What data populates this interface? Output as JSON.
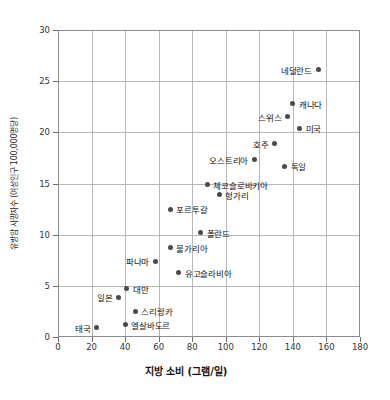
{
  "chart_data": {
    "type": "scatter",
    "title": "",
    "xlabel": "지방 소비 (그램/일)",
    "ylabel": "유방암 사망자수 (여성인구 100,000명당)",
    "xlim": [
      0,
      180
    ],
    "ylim": [
      0,
      30
    ],
    "xticks": [
      0,
      20,
      40,
      60,
      80,
      100,
      120,
      140,
      160,
      180
    ],
    "yticks": [
      0,
      5,
      10,
      15,
      20,
      25,
      30
    ],
    "grid": true,
    "legend": "none",
    "points": [
      {
        "label": "태국",
        "x": 23,
        "y": 0.9,
        "side": "left"
      },
      {
        "label": "엘살바도르",
        "x": 40,
        "y": 1.2,
        "side": "right"
      },
      {
        "label": "스리랑카",
        "x": 46,
        "y": 2.5,
        "side": "right"
      },
      {
        "label": "일본",
        "x": 36,
        "y": 3.9,
        "side": "left"
      },
      {
        "label": "대만",
        "x": 41,
        "y": 4.7,
        "side": "right"
      },
      {
        "label": "유고슬라비아",
        "x": 72,
        "y": 6.3,
        "side": "right"
      },
      {
        "label": "파나마",
        "x": 58,
        "y": 7.4,
        "side": "left"
      },
      {
        "label": "불가리아",
        "x": 67,
        "y": 8.7,
        "side": "right"
      },
      {
        "label": "폴란드",
        "x": 85,
        "y": 10.2,
        "side": "right"
      },
      {
        "label": "포르투갈",
        "x": 67,
        "y": 12.5,
        "side": "right"
      },
      {
        "label": "헝가리",
        "x": 96,
        "y": 13.9,
        "side": "right"
      },
      {
        "label": "체코슬로바키아",
        "x": 89,
        "y": 14.9,
        "side": "right"
      },
      {
        "label": "독일",
        "x": 135,
        "y": 16.7,
        "side": "right"
      },
      {
        "label": "오스트리아",
        "x": 117,
        "y": 17.3,
        "side": "left"
      },
      {
        "label": "호주",
        "x": 129,
        "y": 18.9,
        "side": "left"
      },
      {
        "label": "미국",
        "x": 144,
        "y": 20.4,
        "side": "right"
      },
      {
        "label": "스위스",
        "x": 137,
        "y": 21.5,
        "side": "left"
      },
      {
        "label": "캐나다",
        "x": 140,
        "y": 22.8,
        "side": "right"
      },
      {
        "label": "네덜란드",
        "x": 155,
        "y": 26.1,
        "side": "left"
      }
    ]
  }
}
